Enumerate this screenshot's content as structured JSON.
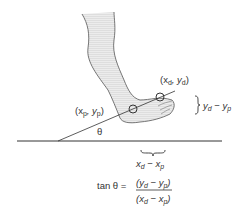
{
  "diagram": {
    "labels": {
      "distal_point": {
        "pre": "(x",
        "sub1": "d",
        "mid": ", y",
        "sub2": "d",
        "post": ")"
      },
      "proximal_point": {
        "pre": "(x",
        "sub1": "p",
        "mid": ", y",
        "sub2": "p",
        "post": ")"
      },
      "dy": {
        "a": "y",
        "sa": "d",
        "op": " − y",
        "sb": "p"
      },
      "dx": {
        "a": "x",
        "sa": "d",
        "op": " − x",
        "sb": "p"
      },
      "theta": "θ",
      "formula": {
        "lhs": "tan θ =",
        "num": {
          "a": "(y",
          "sa": "d",
          "op": " − y",
          "sb": "p",
          "c": ")"
        },
        "den": {
          "a": "(x",
          "sa": "d",
          "op": " − x",
          "sb": "p",
          "c": ")"
        }
      }
    },
    "colors": {
      "line": "#333333",
      "foot_fill": "#e6e6e6",
      "foot_outline": "#555555"
    }
  }
}
